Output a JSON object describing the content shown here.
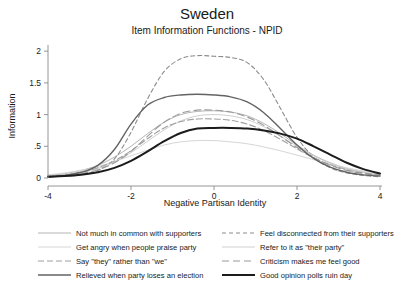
{
  "chart_data": {
    "type": "line",
    "title": "Sweden",
    "subtitle": "Item Information Functions - NPID",
    "xlabel": "Negative Partisan Identity",
    "ylabel": "Information",
    "xlim": [
      -4,
      4
    ],
    "ylim": [
      0,
      2.05
    ],
    "xticks": [
      -4,
      -2,
      0,
      2,
      4
    ],
    "xticklabels": [
      "-4",
      "-2",
      "0",
      "2",
      "4"
    ],
    "yticks": [
      0,
      0.5,
      1,
      1.5,
      2
    ],
    "yticklabels": [
      "0",
      ".5",
      "1",
      "1.5",
      "2"
    ],
    "grid": false,
    "legend_position": "bottom",
    "x": [
      -4,
      -3.6,
      -3.2,
      -2.8,
      -2.4,
      -2,
      -1.6,
      -1.2,
      -0.8,
      -0.4,
      0,
      0.4,
      0.8,
      1.2,
      1.6,
      2,
      2.4,
      2.8,
      3.2,
      3.6,
      4
    ],
    "series": [
      {
        "name": "Not much in common with supporters",
        "color": "#b4b4b4",
        "width": 1.0,
        "dash": "none",
        "values": [
          0.04,
          0.07,
          0.12,
          0.2,
          0.33,
          0.5,
          0.7,
          0.88,
          1.0,
          1.05,
          1.06,
          1.04,
          0.98,
          0.86,
          0.7,
          0.52,
          0.36,
          0.24,
          0.15,
          0.09,
          0.05
        ]
      },
      {
        "name": "Feel disconnected from their supporters",
        "color": "#8c8c8c",
        "width": 1.1,
        "dash": "4,3",
        "values": [
          0.02,
          0.03,
          0.06,
          0.12,
          0.3,
          0.72,
          1.25,
          1.68,
          1.88,
          1.93,
          1.92,
          1.9,
          1.82,
          1.55,
          1.1,
          0.64,
          0.33,
          0.16,
          0.08,
          0.04,
          0.02
        ]
      },
      {
        "name": "Get angry when people praise party",
        "color": "#d6d6d6",
        "width": 1.0,
        "dash": "none",
        "values": [
          0.05,
          0.08,
          0.12,
          0.18,
          0.26,
          0.35,
          0.44,
          0.52,
          0.57,
          0.59,
          0.59,
          0.57,
          0.54,
          0.49,
          0.43,
          0.36,
          0.29,
          0.22,
          0.16,
          0.11,
          0.07
        ]
      },
      {
        "name": "Refer to it as \"their party\"",
        "color": "#cfcfcf",
        "width": 1.0,
        "dash": "none",
        "values": [
          0.03,
          0.05,
          0.09,
          0.15,
          0.25,
          0.4,
          0.58,
          0.76,
          0.9,
          0.98,
          1.0,
          0.98,
          0.92,
          0.81,
          0.66,
          0.5,
          0.35,
          0.23,
          0.14,
          0.09,
          0.05
        ]
      },
      {
        "name": "Say \"they\" rather than \"we\"",
        "color": "#a0a0a0",
        "width": 1.1,
        "dash": "6,3",
        "values": [
          0.03,
          0.05,
          0.09,
          0.16,
          0.27,
          0.43,
          0.62,
          0.79,
          0.89,
          0.93,
          0.93,
          0.91,
          0.85,
          0.75,
          0.61,
          0.46,
          0.32,
          0.21,
          0.13,
          0.08,
          0.05
        ]
      },
      {
        "name": "Criticism makes me feel good",
        "color": "#9a9a9a",
        "width": 1.1,
        "dash": "7,4",
        "values": [
          0.02,
          0.04,
          0.07,
          0.13,
          0.24,
          0.42,
          0.66,
          0.88,
          1.02,
          1.07,
          1.07,
          1.04,
          0.96,
          0.83,
          0.66,
          0.48,
          0.32,
          0.2,
          0.12,
          0.07,
          0.04
        ]
      },
      {
        "name": "Relieved when party loses an election",
        "color": "#636363",
        "width": 1.4,
        "dash": "none",
        "values": [
          0.02,
          0.04,
          0.09,
          0.2,
          0.45,
          0.85,
          1.15,
          1.27,
          1.31,
          1.32,
          1.31,
          1.28,
          1.2,
          1.03,
          0.78,
          0.52,
          0.31,
          0.17,
          0.09,
          0.05,
          0.03
        ]
      },
      {
        "name": "Good opinion polls ruin day",
        "color": "#1c1c1c",
        "width": 2.0,
        "dash": "none",
        "values": [
          0.02,
          0.03,
          0.05,
          0.09,
          0.16,
          0.27,
          0.42,
          0.58,
          0.71,
          0.78,
          0.79,
          0.79,
          0.78,
          0.75,
          0.7,
          0.62,
          0.5,
          0.37,
          0.24,
          0.14,
          0.07
        ]
      }
    ]
  },
  "legend": {
    "rows": [
      {
        "left": "Not much in common with supporters",
        "right": "Feel disconnected from their supporters"
      },
      {
        "left": "Get angry when people praise party",
        "right": "Refer to it as \"their party\""
      },
      {
        "left": "Say \"they\" rather than \"we\"",
        "right": "Criticism makes me feel good"
      },
      {
        "left": "Relieved when party loses an election",
        "right": "Good opinion polls ruin day"
      }
    ]
  }
}
